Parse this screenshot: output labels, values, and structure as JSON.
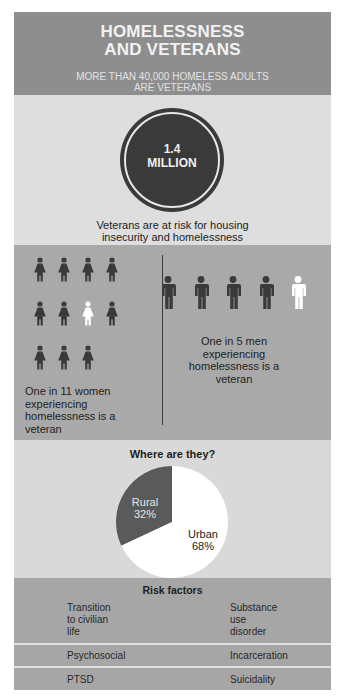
{
  "header": {
    "title_line1": "HOMELESSNESS",
    "title_line2": "AND VETERANS",
    "subtitle_line1": "MORE THAN 40,000 HOMELESS ADULTS",
    "subtitle_line2": "ARE VETERANS"
  },
  "stat": {
    "value_line1": "1.4",
    "value_line2": "MILLION",
    "caption_line1": "Veterans are at risk for housing",
    "caption_line2": "insecurity and homelessness"
  },
  "women": {
    "icon": "woman-figure-icon",
    "total": 11,
    "highlighted": 1,
    "highlighted_position": 7,
    "caption_lines": [
      "One in 11 women",
      "experiencing",
      "homelessness is a",
      "veteran"
    ]
  },
  "men": {
    "icon": "man-figure-icon",
    "total": 5,
    "highlighted": 1,
    "highlighted_position": 5,
    "caption_lines": [
      "One in 5 men",
      "experiencing",
      "homelessness is a",
      "veteran"
    ]
  },
  "colors": {
    "figure_dark": "#3a3a3a",
    "figure_highlight": "#ffffff",
    "rural_slice": "#5a5a5a",
    "urban_slice": "#ffffff"
  },
  "chart_data": {
    "type": "pie",
    "title": "Where are they?",
    "categories": [
      "Rural",
      "Urban"
    ],
    "values": [
      32,
      68
    ],
    "labels": [
      "32%",
      "68%"
    ]
  },
  "risk": {
    "title": "Risk factors",
    "rows": [
      {
        "left": [
          "Transition",
          "to civilian",
          "life"
        ],
        "right": [
          "Substance",
          "use",
          "disorder"
        ]
      },
      {
        "left": [
          "Psychosocial"
        ],
        "right": [
          "Incarceration"
        ]
      },
      {
        "left": [
          "PTSD"
        ],
        "right": [
          "Suicidality"
        ]
      }
    ]
  }
}
